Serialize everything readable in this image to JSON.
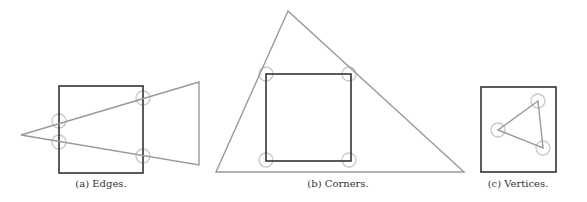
{
  "colors": {
    "square": "#333333",
    "triangle": "#999999",
    "circle": "#c8c8c8",
    "caption": "#333333"
  },
  "panels": [
    {
      "id": "a",
      "caption": "(a)  Edges.",
      "caption_pos": [
        101,
        184
      ],
      "square": {
        "x": 59,
        "y": 86,
        "w": 84,
        "h": 87
      },
      "triangle": [
        [
          21,
          135
        ],
        [
          199,
          82
        ],
        [
          199,
          165
        ]
      ],
      "circles": [
        [
          59,
          121
        ],
        [
          59,
          142
        ],
        [
          143,
          98
        ],
        [
          143,
          156
        ]
      ]
    },
    {
      "id": "b",
      "caption": "(b)  Corners.",
      "caption_pos": [
        338,
        184
      ],
      "square": {
        "x": 266,
        "y": 74,
        "w": 85,
        "h": 87
      },
      "triangle": [
        [
          288,
          11
        ],
        [
          216,
          172
        ],
        [
          464,
          172
        ]
      ],
      "circles": [
        [
          266,
          74
        ],
        [
          349,
          74
        ],
        [
          266,
          160
        ],
        [
          349,
          160
        ]
      ]
    },
    {
      "id": "c",
      "caption": "(c)  Vertices.",
      "caption_pos": [
        518,
        184
      ],
      "square": {
        "x": 481,
        "y": 87,
        "w": 75,
        "h": 85
      },
      "triangle": [
        [
          538,
          101
        ],
        [
          498,
          130
        ],
        [
          543,
          148
        ]
      ],
      "circles": [
        [
          538,
          101
        ],
        [
          498,
          130
        ],
        [
          543,
          148
        ]
      ]
    }
  ]
}
